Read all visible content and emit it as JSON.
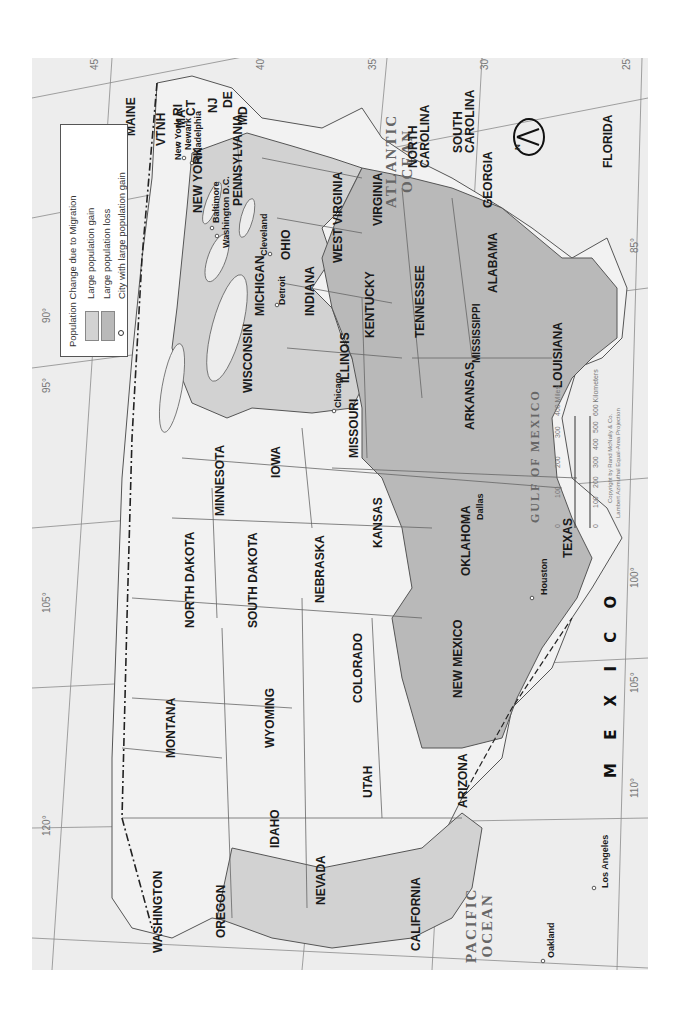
{
  "legend": {
    "title": "Population Change due to Migration",
    "items": [
      {
        "label": "Large population gain",
        "color": "#d2d2d2"
      },
      {
        "label": "Large population loss",
        "color": "#b9b9b9"
      },
      {
        "label": "City with large population gain",
        "symbol": "circle"
      }
    ]
  },
  "countries": [
    "C A N A D A",
    "M E X I C O"
  ],
  "oceans": {
    "atlantic": "ATLANTIC\nOCEAN",
    "pacific": "PACIFIC\nOCEAN",
    "gulf": "GULF OF MEXICO"
  },
  "lakes": [
    "Lake Superior",
    "Lake Michigan",
    "Lake Huron",
    "Lake Erie",
    "Lake Ontario"
  ],
  "states": {
    "gain": [
      "NEW YORK",
      "PENNSYLVANIA",
      "NJ",
      "DE",
      "MD",
      "OHIO",
      "MICHIGAN",
      "INDIANA",
      "ILLINOIS",
      "WISCONSIN",
      "CALIFORNIA"
    ],
    "loss": [
      "VIRGINIA",
      "WEST VIRGINIA",
      "KENTUCKY",
      "TENNESSEE",
      "NORTH CAROLINA",
      "SOUTH CAROLINA",
      "GEORGIA",
      "ALABAMA",
      "MISSISSIPPI",
      "ARKANSAS",
      "LOUISIANA",
      "TEXAS",
      "FLORIDA"
    ],
    "neutral": [
      "MAINE",
      "VT",
      "NH",
      "MA",
      "CT",
      "RI",
      "MINNESOTA",
      "IOWA",
      "MISSOURI",
      "NORTH DAKOTA",
      "SOUTH DAKOTA",
      "NEBRASKA",
      "KANSAS",
      "OKLAHOMA",
      "MONTANA",
      "WYOMING",
      "COLORADO",
      "NEW MEXICO",
      "IDAHO",
      "UTAH",
      "ARIZONA",
      "NEVADA",
      "WASHINGTON",
      "OREGON"
    ]
  },
  "state_labels": {
    "maine": "MAINE",
    "vt": "VT",
    "nh": "NH",
    "ma": "MA",
    "ct": "CT",
    "ri": "RI",
    "nj": "NJ",
    "de": "DE",
    "md": "MD",
    "newyork": "NEW YORK",
    "pennsylvania": "PENNSYLVANIA",
    "ohio": "OHIO",
    "michigan": "MICHIGAN",
    "indiana": "INDIANA",
    "illinois": "ILLINOIS",
    "wisconsin": "WISCONSIN",
    "minnesota": "MINNESOTA",
    "iowa": "IOWA",
    "missouri": "MISSOURI",
    "kentucky": "KENTUCKY",
    "tennessee": "TENNESSEE",
    "virginia": "VIRGINIA",
    "westvirginia": "WEST\nVIRGINIA",
    "northcarolina": "NORTH\nCAROLINA",
    "southcarolina": "SOUTH\nCAROLINA",
    "georgia": "GEORGIA",
    "alabama": "ALABAMA",
    "mississippi": "MISSISSIPPI",
    "arkansas": "ARKANSAS",
    "louisiana": "LOUISIANA",
    "florida": "FLORIDA",
    "texas": "TEXAS",
    "oklahoma": "OKLAHOMA",
    "kansas": "KANSAS",
    "nebraska": "NEBRASKA",
    "southdakota": "SOUTH DAKOTA",
    "northdakota": "NORTH DAKOTA",
    "montana": "MONTANA",
    "wyoming": "WYOMING",
    "colorado": "COLORADO",
    "newmexico": "NEW MEXICO",
    "idaho": "IDAHO",
    "utah": "UTAH",
    "arizona": "ARIZONA",
    "nevada": "NEVADA",
    "washington": "WASHINGTON",
    "oregon": "OREGON",
    "california": "CALIFORNIA"
  },
  "cities": [
    "New York",
    "Newark",
    "Philadelphia",
    "Baltimore",
    "Washington D.C.",
    "Cleveland",
    "Detroit",
    "Chicago",
    "Dallas",
    "Houston",
    "Oakland",
    "Los Angeles"
  ],
  "latitude_ticks": [
    "45°",
    "40°",
    "35°",
    "30°",
    "25°"
  ],
  "longitude_ticks": [
    "70°",
    "75°",
    "80°",
    "85°",
    "90°",
    "95°",
    "100°",
    "105°",
    "110°",
    "115°",
    "120°",
    "125°"
  ],
  "scale_bar": {
    "miles": [
      "0",
      "100",
      "200",
      "300",
      "400 Miles"
    ],
    "kilometers": [
      "0",
      "100",
      "200",
      "300",
      "400",
      "500",
      "600 Kilometers"
    ]
  },
  "credits": [
    "Copyright by Rand McNally & Co.",
    "Lambert Azimuthal Equal-Area Projection"
  ],
  "compass": {
    "label": "N"
  },
  "colors": {
    "gain": "#d2d2d2",
    "loss": "#b9b9b9",
    "neutral": "#f2f2f2",
    "water": "#ededed",
    "border": "#555555"
  }
}
